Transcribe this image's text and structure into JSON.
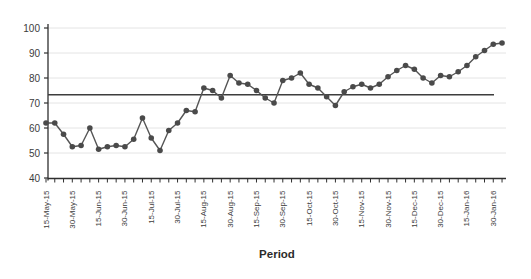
{
  "chart_data": {
    "type": "line",
    "title": "",
    "xlabel": "Period",
    "ylabel": "",
    "ylim": [
      40,
      100
    ],
    "yticks": [
      40,
      50,
      60,
      70,
      80,
      90,
      100
    ],
    "x_tick_labels": [
      "15-May-15",
      "30-May-15",
      "15-Jun-15",
      "30-Jun-15",
      "15-Jul-15",
      "30-Jul-15",
      "15-Aug-15",
      "30-Aug-15",
      "15-Sep-15",
      "30-Sep-15",
      "15-Oct-15",
      "30-Oct-15",
      "15-Nov-15",
      "30-Nov-15",
      "15-Dec-15",
      "30-Dec-15",
      "15-Jan-16",
      "30-Jan-16"
    ],
    "label_every_n_points": 3,
    "grid": "horizontal-light",
    "legend": "none",
    "series": [
      {
        "name": "measurement",
        "marker": "circle",
        "values": [
          62,
          62,
          57.5,
          52.5,
          53,
          60,
          51.5,
          52.5,
          53,
          52.5,
          55.5,
          64,
          56,
          51,
          59,
          62,
          67,
          66.5,
          76,
          75,
          72,
          81,
          78,
          77.5,
          75,
          72,
          70,
          79,
          80,
          82,
          77.5,
          76,
          72.5,
          69,
          74.5,
          76.5,
          77.5,
          76,
          77.5,
          80.5,
          83,
          85,
          83.5,
          80,
          78,
          81,
          80.5,
          82.5,
          85,
          88.5,
          91,
          93.5,
          94
        ]
      }
    ],
    "reference_line": {
      "value": 73.3,
      "style": "solid-dark"
    },
    "colors": {
      "series": "#555555",
      "marker": "#4a4a4a",
      "reference": "#3d3d3d",
      "grid": "#e4e4e4",
      "axis": "#2f2f2f",
      "text": "#3c3c3c",
      "background": "#ffffff"
    }
  }
}
